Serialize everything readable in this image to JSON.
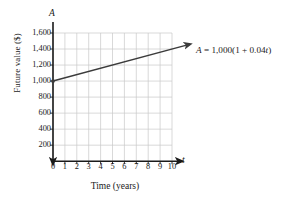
{
  "chart_data": {
    "type": "line",
    "title": "",
    "subtitle": "",
    "xlabel": "Time (years)",
    "ylabel": "Future value ($)",
    "x_axis_symbol": "t",
    "y_axis_symbol": "A",
    "xlim": [
      0,
      10
    ],
    "ylim": [
      0,
      1600
    ],
    "grid": true,
    "legend": "none",
    "x": [
      0,
      1,
      2,
      3,
      4,
      5,
      6,
      7,
      8,
      9,
      10
    ],
    "series": [
      {
        "name": "A = 1,000(1 + 0.04t)",
        "values": [
          1000,
          1040,
          1080,
          1120,
          1160,
          1200,
          1240,
          1280,
          1320,
          1360,
          1400
        ],
        "color": "#3b3b3b"
      }
    ],
    "xticks": [
      "0",
      "1",
      "2",
      "3",
      "4",
      "5",
      "6",
      "7",
      "8",
      "9",
      "10"
    ],
    "yticks": [
      "200",
      "400",
      "600",
      "800",
      "1,000",
      "1,200",
      "1,400",
      "1,600"
    ],
    "ytick_values": [
      200,
      400,
      600,
      800,
      1000,
      1200,
      1400,
      1600
    ],
    "annotations": [
      {
        "name": "equation-label",
        "prefix": "A",
        "body": " = 1,000(1 + 0.04",
        "variable": "t",
        "suffix": ")",
        "full_text": "A = 1,000(1 + 0.04t)"
      }
    ],
    "colors": {
      "grid": "#c9c9c9",
      "axis": "#1a1a1a",
      "line": "#3b3b3b",
      "background": "#ffffff",
      "text": "#1a1a1a"
    }
  }
}
